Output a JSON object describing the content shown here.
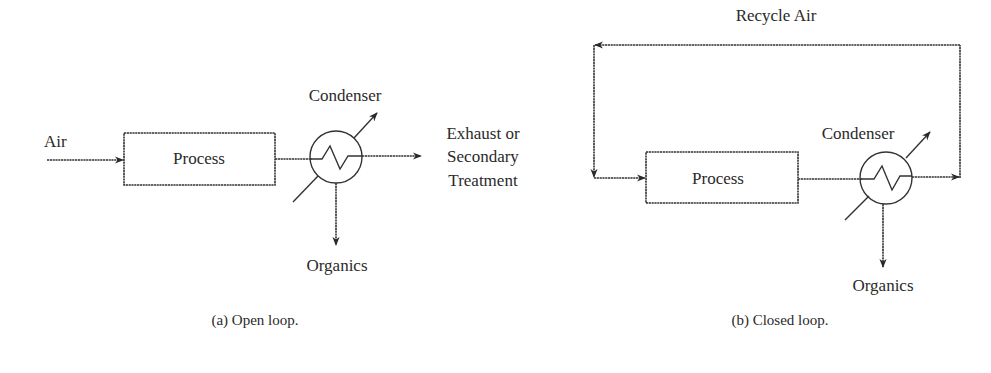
{
  "figure": {
    "open_loop": {
      "caption": "(a) Open loop.",
      "inlet_label": "Air",
      "process_label": "Process",
      "condenser_label": "Condenser",
      "outlet_label_lines": [
        "Exhaust or",
        "Secondary",
        "Treatment"
      ],
      "bottom_label": "Organics"
    },
    "closed_loop": {
      "caption": "(b) Closed loop.",
      "recycle_label": "Recycle Air",
      "process_label": "Process",
      "condenser_label": "Condenser",
      "bottom_label": "Organics"
    }
  },
  "colors": {
    "line": "#333333",
    "text": "#2a2a2a",
    "background": "#ffffff"
  }
}
